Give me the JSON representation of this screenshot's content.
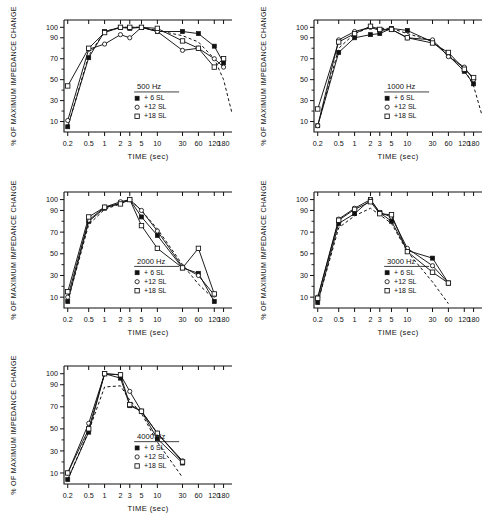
{
  "figure": {
    "caption": "",
    "axis": {
      "xlabel": "TIME (sec)",
      "ylabel": "% OF MAXIMUM IMPEDANCE CHANGE",
      "xticklabels": [
        "0.2",
        "0.5",
        "1",
        "2",
        "3",
        "5",
        "10",
        "30",
        "60",
        "120",
        "180"
      ],
      "xtickvalues": [
        0.2,
        0.5,
        1,
        2,
        3,
        5,
        10,
        30,
        60,
        120,
        180
      ],
      "yticklabels": [
        "10",
        "30",
        "50",
        "70",
        "90",
        "100"
      ],
      "ytickvalues": [
        10,
        30,
        50,
        70,
        90,
        100
      ],
      "xlim": [
        0.17,
        260
      ],
      "ylim": [
        0,
        107
      ],
      "grid": false
    },
    "legend": {
      "entries": [
        {
          "label": "+ 6 SL",
          "marker": "filled-square"
        },
        {
          "label": "+12 SL",
          "marker": "open-circle"
        },
        {
          "label": "+18 SL",
          "marker": "open-square"
        }
      ],
      "position": "inside-lower-center"
    }
  },
  "chart_data": [
    {
      "type": "line",
      "title": "500 Hz",
      "xlabel": "TIME (sec)",
      "ylabel": "% OF MAXIMUM IMPEDANCE CHANGE",
      "xscale": "log",
      "xlim": [
        0.17,
        260
      ],
      "ylim": [
        0,
        107
      ],
      "x": [
        0.2,
        0.5,
        1,
        2,
        3,
        5,
        10,
        30,
        60,
        120,
        180
      ],
      "series": [
        {
          "name": "+ 6 SL",
          "marker": "filled-square",
          "values": [
            5,
            71,
            96,
            100,
            99,
            100,
            96,
            96,
            94,
            82,
            66
          ]
        },
        {
          "name": "+12 SL",
          "marker": "open-circle",
          "values": [
            11,
            79,
            84,
            93,
            90,
            100,
            96,
            78,
            80,
            70,
            62
          ]
        },
        {
          "name": "+18 SL",
          "marker": "open-square",
          "values": [
            44,
            80,
            95,
            100,
            100,
            100,
            99,
            87,
            80,
            62,
            70
          ]
        }
      ],
      "reference_curve": {
        "style": "dashed",
        "x": [
          0.2,
          0.5,
          1,
          2,
          3,
          5,
          10,
          30,
          60,
          120,
          180,
          260
        ],
        "values": [
          5,
          73,
          96,
          100,
          100,
          100,
          97,
          92,
          86,
          70,
          50,
          18
        ]
      }
    },
    {
      "type": "line",
      "title": "1000 Hz",
      "xlabel": "TIME (sec)",
      "ylabel": "% OF MAXIMUM IMPEDANCE CHANGE",
      "xscale": "log",
      "xlim": [
        0.17,
        260
      ],
      "ylim": [
        0,
        107
      ],
      "x": [
        0.2,
        0.5,
        1,
        2,
        3,
        5,
        10,
        30,
        60,
        120,
        180
      ],
      "series": [
        {
          "name": "+ 6 SL",
          "marker": "filled-square",
          "values": [
            6,
            76,
            90,
            93,
            94,
            99,
            97,
            86,
            73,
            58,
            46
          ]
        },
        {
          "name": "+12 SL",
          "marker": "open-circle",
          "values": [
            6,
            88,
            96,
            100,
            97,
            98,
            90,
            88,
            72,
            62,
            50
          ]
        },
        {
          "name": "+18 SL",
          "marker": "open-square",
          "values": [
            22,
            86,
            94,
            101,
            98,
            98,
            90,
            85,
            76,
            60,
            52
          ]
        }
      ],
      "reference_curve": {
        "style": "dashed",
        "x": [
          0.2,
          0.5,
          1,
          2,
          3,
          5,
          10,
          30,
          60,
          120,
          180,
          260
        ],
        "values": [
          6,
          80,
          94,
          100,
          99,
          99,
          94,
          87,
          74,
          60,
          44,
          16
        ]
      }
    },
    {
      "type": "line",
      "title": "2000 Hz",
      "xlabel": "TIME (sec)",
      "ylabel": "% OF MAXIMUM IMPEDANCE CHANGE",
      "xscale": "log",
      "xlim": [
        0.17,
        260
      ],
      "ylim": [
        0,
        107
      ],
      "x": [
        0.2,
        0.5,
        1,
        2,
        3,
        5,
        10,
        30,
        60,
        120
      ],
      "series": [
        {
          "name": "+ 6 SL",
          "marker": "filled-square",
          "values": [
            6,
            80,
            92,
            97,
            100,
            84,
            67,
            37,
            32,
            6
          ]
        },
        {
          "name": "+12 SL",
          "marker": "open-circle",
          "values": [
            10,
            81,
            93,
            98,
            100,
            90,
            71,
            38,
            30,
            12
          ]
        },
        {
          "name": "+18 SL",
          "marker": "open-square",
          "values": [
            15,
            84,
            93,
            96,
            100,
            76,
            55,
            37,
            55,
            13
          ]
        }
      ],
      "reference_curve": {
        "style": "dashed",
        "x": [
          0.2,
          0.5,
          1,
          2,
          3,
          5,
          10,
          30,
          60,
          120
        ],
        "values": [
          6,
          77,
          91,
          96,
          100,
          90,
          73,
          40,
          22,
          8
        ]
      }
    },
    {
      "type": "line",
      "title": "3000 Hz",
      "xlabel": "TIME (sec)",
      "ylabel": "% OF MAXIMUM IMPEDANCE CHANGE",
      "xscale": "log",
      "xlim": [
        0.17,
        260
      ],
      "ylim": [
        0,
        107
      ],
      "x": [
        0.2,
        0.5,
        1,
        2,
        3,
        5,
        10,
        30,
        60
      ],
      "series": [
        {
          "name": "+ 6 SL",
          "marker": "filled-square",
          "values": [
            5,
            78,
            87,
            100,
            88,
            80,
            53,
            46,
            23
          ]
        },
        {
          "name": "+12 SL",
          "marker": "open-circle",
          "values": [
            10,
            82,
            92,
            100,
            88,
            84,
            55,
            39,
            23
          ]
        },
        {
          "name": "+18 SL",
          "marker": "open-square",
          "values": [
            9,
            81,
            91,
            98,
            87,
            86,
            52,
            33,
            23
          ]
        }
      ],
      "reference_curve": {
        "style": "dashed",
        "x": [
          0.2,
          0.5,
          1,
          2,
          3,
          5,
          10,
          30,
          60
        ],
        "values": [
          5,
          74,
          85,
          92,
          86,
          78,
          52,
          24,
          4
        ]
      }
    },
    {
      "type": "line",
      "title": "4000 Hz",
      "xlabel": "TIME (sec)",
      "ylabel": "% OF MAXIMUM IMPEDANCE CHANGE",
      "xscale": "log",
      "xlim": [
        0.17,
        260
      ],
      "ylim": [
        0,
        107
      ],
      "x": [
        0.2,
        0.5,
        1,
        2,
        3,
        5,
        10,
        30
      ],
      "series": [
        {
          "name": "+ 6 SL",
          "marker": "filled-square",
          "values": [
            4,
            47,
            100,
            96,
            71,
            66,
            41,
            19
          ]
        },
        {
          "name": "+12 SL",
          "marker": "open-circle",
          "values": [
            10,
            55,
            100,
            99,
            84,
            66,
            46,
            21
          ]
        },
        {
          "name": "+18 SL",
          "marker": "open-square",
          "values": [
            10,
            50,
            100,
            99,
            72,
            66,
            46,
            20
          ]
        }
      ],
      "reference_curve": {
        "style": "dashed",
        "x": [
          0.2,
          0.5,
          1,
          2,
          3,
          5,
          10,
          30
        ],
        "values": [
          4,
          48,
          88,
          89,
          76,
          64,
          38,
          6
        ]
      }
    }
  ]
}
